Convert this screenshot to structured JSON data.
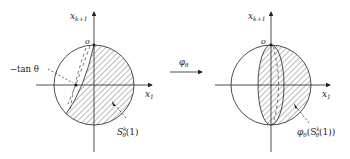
{
  "left_panel": {
    "axis_y_label": "x",
    "axis_y_sub": "k+1",
    "axis_x_label": "x",
    "axis_x_sub": "1",
    "origin_label": "o",
    "point_label": "−tan θ",
    "region_label": "S",
    "region_sup": "k",
    "region_sub": "θ",
    "region_arg": "(1)"
  },
  "map_arrow": {
    "label": "φ",
    "label_sub": "θ"
  },
  "right_panel": {
    "axis_y_label": "x",
    "axis_y_sub": "k+1",
    "axis_x_label": "x",
    "axis_x_sub": "1",
    "origin_label": "o",
    "region_label_prefix": "φ",
    "region_label_prefix_sub": "θ",
    "region_label": "(S",
    "region_sup": "k",
    "region_sub": "θ",
    "region_arg": "(1))"
  },
  "colors": {
    "stroke": "#222222",
    "hatch": "#555555",
    "background": "#ffffff"
  }
}
